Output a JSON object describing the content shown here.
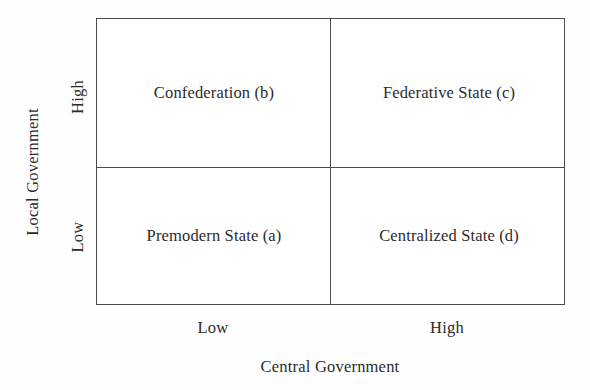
{
  "chart_data": {
    "type": "table",
    "title": "",
    "xlabel": "Central Government",
    "ylabel": "Local Government",
    "x_categories": [
      "Low",
      "High"
    ],
    "y_categories": [
      "Low",
      "High"
    ],
    "grid": true,
    "legend": "none",
    "cells": [
      {
        "id": "b",
        "label": "Confederation (b)",
        "x_category": "Low",
        "y_category": "High",
        "position": "top-left"
      },
      {
        "id": "c",
        "label": "Federative State (c)",
        "x_category": "High",
        "y_category": "High",
        "position": "top-right"
      },
      {
        "id": "a",
        "label": "Premodern State (a)",
        "x_category": "Low",
        "y_category": "Low",
        "position": "bottom-left"
      },
      {
        "id": "d",
        "label": "Centralized State (d)",
        "x_category": "High",
        "y_category": "Low",
        "position": "bottom-right"
      }
    ]
  },
  "axes": {
    "y": {
      "title": "Local Government",
      "tick_high": "High",
      "tick_low": "Low"
    },
    "x": {
      "title": "Central Government",
      "tick_low": "Low",
      "tick_high": "High"
    }
  },
  "quadrants": {
    "top_left": "Confederation (b)",
    "top_right": "Federative State (c)",
    "bottom_left": "Premodern State (a)",
    "bottom_right": "Centralized State (d)"
  },
  "colors": {
    "border": "#4a4a4a",
    "text": "#2b2b2b",
    "background": "#fefefe",
    "plot_background": "#ffffff"
  }
}
